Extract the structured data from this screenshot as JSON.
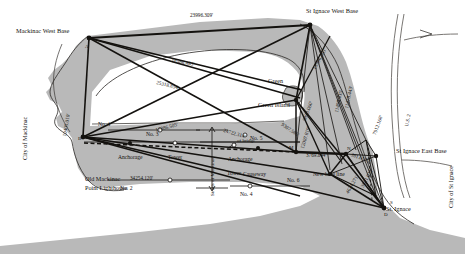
{
  "figure": {
    "kind": "triangulation-survey-map",
    "region": "Straits of Mackinac",
    "ink": "#14120f",
    "land_fill": "#b9b9b9",
    "water_fill": "#ffffff",
    "paper": "#ffffff"
  },
  "places": {
    "mackinaw_west_base": "Mackinac West Base",
    "st_ignace_west_base": "St Ignace West Base",
    "st_ignace_east_base": "St Ignace East Base",
    "st_ignace": "St. Ignace",
    "old_mackinac_point_lighthouse_l1": "Old Mackinac",
    "old_mackinac_point_lighthouse_l2": "Point Lighthouse",
    "city_of_mackinac": "City of Mackinac",
    "city_of_st_ignace": "City of St Ignace",
    "green": "Green",
    "green_island": "Green Island",
    "straits_of_mackinac": "Straits of Mackinac",
    "us_highway": "U.S. 2"
  },
  "features": {
    "anchorage_west": "Anchorage",
    "anchorage_east": "Anchorage",
    "tower_west": "Tower",
    "tower_east": "Tower",
    "causeway": "Causeway",
    "new_base_line": "New base line",
    "center_of_bridge": "of bridge"
  },
  "stations": {
    "point_a": "A",
    "point_b": "B",
    "point_d": "D",
    "point_m": "M",
    "point_n": "N",
    "point_s": "S",
    "no1": "No. 1",
    "no2": "No. 2",
    "no3": "No. 3",
    "no4": "No. 4",
    "no5": "No. 5",
    "no6": "No. 6"
  },
  "distances": {
    "top_long": "23996.309'",
    "diag_1": "18586.483'",
    "diag_2": "25318.854'",
    "diag_3": "17886.505'",
    "diag_4": "24722.314'",
    "bottom_left": "34254.120'",
    "west_vertical": "10405.010'",
    "new_base": "3769.844'",
    "east_base_short": "3813.570'",
    "green_a": "13996.505'",
    "green_b": "11490.435'",
    "green_c": "11478.443'",
    "green_d": "9893.060'",
    "green_e": "9307.586'",
    "green_f": "12007.819'",
    "east_a": "3821.022'",
    "east_b": "4624.271'",
    "east_c": "7912.168'"
  }
}
